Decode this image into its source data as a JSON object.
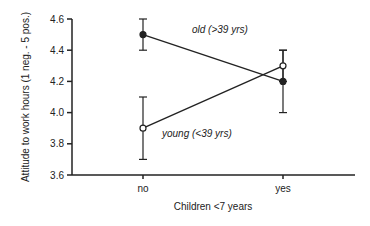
{
  "chart_data": {
    "type": "line",
    "title": "",
    "xlabel": "Children <7 years",
    "ylabel": "Attitude to work hours (1 neg. - 5 pos.)",
    "categories": [
      "no",
      "yes"
    ],
    "ylim": [
      3.6,
      4.6
    ],
    "yticks": [
      "3.6",
      "3.8",
      "4.0",
      "4.2",
      "4.4",
      "4.6"
    ],
    "grid": false,
    "series": [
      {
        "name": "old (>39 yrs)",
        "marker": "filled-circle",
        "values": [
          4.5,
          4.2
        ],
        "error_low": [
          4.4,
          4.0
        ],
        "error_high": [
          4.6,
          4.4
        ]
      },
      {
        "name": "young (<39 yrs)",
        "marker": "open-circle",
        "values": [
          3.9,
          4.3
        ],
        "error_low": [
          3.7,
          4.2
        ],
        "error_high": [
          4.1,
          4.4
        ]
      }
    ]
  }
}
